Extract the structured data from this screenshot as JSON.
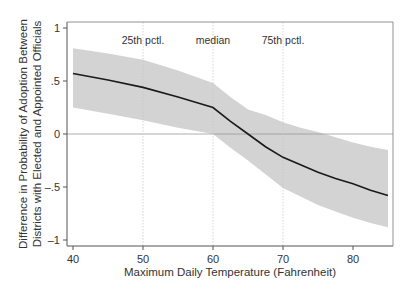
{
  "chart_data": {
    "type": "line",
    "title": "",
    "xlabel": "Maximum Daily Temperature (Fahrenheit)",
    "ylabel_lines": [
      "Difference in Probability of Adoption Between",
      "Districts with Elected and Appointed Officials"
    ],
    "xlim": [
      39,
      86
    ],
    "ylim": [
      -1.05,
      1.05
    ],
    "xticks": [
      40,
      50,
      60,
      70,
      80
    ],
    "xtick_labels": [
      "40",
      "50",
      "60",
      "70",
      "80"
    ],
    "yticks": [
      1,
      0.5,
      0,
      -0.5,
      -1
    ],
    "ytick_labels": [
      "1",
      ".5",
      "0",
      "–.5",
      "–1"
    ],
    "grid": false,
    "reference_lines": {
      "horizontal": [
        0
      ],
      "vertical": [
        {
          "x": 50,
          "label": "25th pctl."
        },
        {
          "x": 60,
          "label": "median"
        },
        {
          "x": 70,
          "label": "75th pctl."
        }
      ]
    },
    "series": [
      {
        "name": "Difference (point estimate)",
        "x": [
          40,
          45,
          50,
          55,
          60,
          62.5,
          65,
          67.5,
          70,
          72.5,
          75,
          77.5,
          80,
          82.5,
          85
        ],
        "y": [
          0.57,
          0.51,
          0.44,
          0.35,
          0.25,
          0.12,
          0.0,
          -0.12,
          -0.22,
          -0.29,
          -0.36,
          -0.42,
          -0.47,
          -0.53,
          -0.58
        ],
        "lower": [
          0.25,
          0.19,
          0.13,
          0.06,
          0.0,
          -0.13,
          -0.25,
          -0.38,
          -0.51,
          -0.59,
          -0.67,
          -0.73,
          -0.79,
          -0.84,
          -0.88
        ],
        "upper": [
          0.81,
          0.76,
          0.7,
          0.6,
          0.48,
          0.35,
          0.23,
          0.18,
          0.11,
          0.06,
          0.02,
          -0.03,
          -0.08,
          -0.12,
          -0.15
        ]
      }
    ],
    "colors": {
      "line": "#1a1a1a",
      "band": "#d3d3d3",
      "frame": "#555555",
      "refline": "#c8c8c8",
      "text": "#333333"
    }
  }
}
